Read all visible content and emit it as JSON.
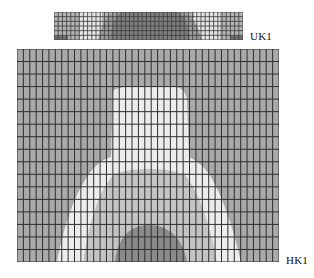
{
  "figure": {
    "type": "finite-element mesh contour plots",
    "background": "#ffffff"
  },
  "top_mesh": {
    "label": "UK1",
    "bounds": {
      "x": 54,
      "y": 12,
      "width": 189,
      "height": 28
    },
    "grid": {
      "columns": 45,
      "rows": 6,
      "line_color": "#3a3a3a"
    },
    "regions": [
      {
        "name": "outer-light",
        "color": "#b4b4b4"
      },
      {
        "name": "white-band",
        "color": "#e6e6e6"
      },
      {
        "name": "mid-gray",
        "color": "#9a9a9a"
      },
      {
        "name": "dark-center",
        "color": "#7e7e7e"
      }
    ]
  },
  "bottom_mesh": {
    "label": "HK1",
    "bounds": {
      "x": 17,
      "y": 49,
      "width": 262,
      "height": 213
    },
    "grid": {
      "columns": 41,
      "rows": 17,
      "line_color": "#2e2e2e"
    },
    "regions": [
      {
        "name": "background-gray",
        "color": "#a9a9a9"
      },
      {
        "name": "white-bell",
        "color": "#ececec"
      },
      {
        "name": "light-gray-band",
        "color": "#c4c4c4"
      },
      {
        "name": "dark-dome",
        "color": "#8a8a8a"
      }
    ]
  }
}
